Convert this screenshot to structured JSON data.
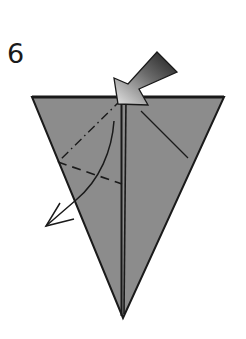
{
  "step": {
    "number": "6"
  },
  "diagram": {
    "type": "origami-step",
    "paper_color": "#8c8c8c",
    "line_color": "#1a1a1a",
    "shape": "inverted triangle (kite base, layered center)",
    "symbols": [
      "push-in-arrow (gradient, pointing down-left to top center)",
      "mountain-fold line (dash-dot) on left flap",
      "valley-fold line (dashed) on left flap",
      "curved fold arrow toward lower left",
      "existing crease on right flap"
    ]
  }
}
